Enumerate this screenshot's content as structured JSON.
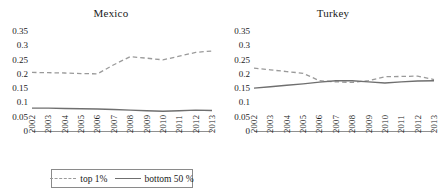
{
  "figure": {
    "legend": {
      "top_label": "top 1%",
      "bottom_label": "bottom 50 %",
      "top_swatch": "dashed-line-icon",
      "bottom_swatch": "solid-line-icon"
    },
    "colors": {
      "top1": "#9a9a9a",
      "bottom50": "#6f6f6f",
      "axis": "#909090",
      "text": "#1a1a1a"
    }
  },
  "chart_data": [
    {
      "type": "line",
      "title": "Mexico",
      "xlabel": "",
      "ylabel": "",
      "x": [
        "2002",
        "2003",
        "2004",
        "2005",
        "2006",
        "2007",
        "2008",
        "2009",
        "2010",
        "2011",
        "2012",
        "2013"
      ],
      "ylim": [
        0,
        0.35
      ],
      "yticks": [
        "0",
        "0.05",
        "0.1",
        "0.15",
        "0.2",
        "0.25",
        "0.3",
        "0.35"
      ],
      "ytick_values": [
        0,
        0.05,
        0.1,
        0.15,
        0.2,
        0.25,
        0.3,
        0.35
      ],
      "grid": false,
      "legend_position": "bottom",
      "series": [
        {
          "name": "top 1%",
          "style": "dashed",
          "values": [
            0.205,
            0.204,
            0.203,
            0.201,
            0.2,
            0.232,
            0.26,
            0.255,
            0.249,
            0.262,
            0.275,
            0.28
          ]
        },
        {
          "name": "bottom 50 %",
          "style": "solid",
          "values": [
            0.08,
            0.08,
            0.079,
            0.078,
            0.077,
            0.075,
            0.073,
            0.071,
            0.069,
            0.071,
            0.073,
            0.072
          ]
        }
      ]
    },
    {
      "type": "line",
      "title": "Turkey",
      "xlabel": "",
      "ylabel": "",
      "x": [
        "2002",
        "2003",
        "2004",
        "2005",
        "2006",
        "2007",
        "2008",
        "2009",
        "2010",
        "2011",
        "2012",
        "2013"
      ],
      "ylim": [
        0,
        0.35
      ],
      "yticks": [
        "0",
        "0.05",
        "0.1",
        "0.15",
        "0.2",
        "0.25",
        "0.3",
        "0.35"
      ],
      "ytick_values": [
        0,
        0.05,
        0.1,
        0.15,
        0.2,
        0.25,
        0.3,
        0.35
      ],
      "grid": false,
      "legend_position": "bottom",
      "series": [
        {
          "name": "top 1%",
          "style": "dashed",
          "values": [
            0.22,
            0.214,
            0.208,
            0.202,
            0.176,
            0.172,
            0.17,
            0.176,
            0.19,
            0.191,
            0.192,
            0.18
          ]
        },
        {
          "name": "bottom 50 %",
          "style": "solid",
          "values": [
            0.15,
            0.155,
            0.16,
            0.165,
            0.171,
            0.176,
            0.176,
            0.172,
            0.168,
            0.172,
            0.175,
            0.176
          ]
        }
      ]
    }
  ]
}
